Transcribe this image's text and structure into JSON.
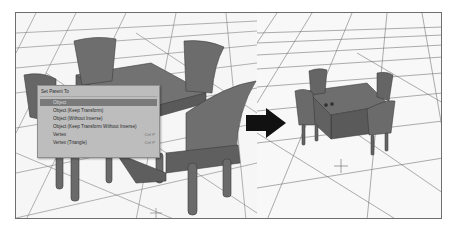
{
  "figure": {
    "frame_border_color": "#6e6e6e",
    "grid_line_color": "#4a4a4a",
    "model_color": "#676767"
  },
  "menu": {
    "title": "Set Parent To",
    "items": [
      {
        "label": "Object",
        "shortcut": "",
        "selected": true
      },
      {
        "label": "Object (Keep Transform)",
        "shortcut": "",
        "selected": false
      },
      {
        "label": "Object (Without Inverse)",
        "shortcut": "",
        "selected": false
      },
      {
        "label": "Object (Keep Transform Without Inverse)",
        "shortcut": "",
        "selected": false
      },
      {
        "label": "Vertex",
        "shortcut": "Ctrl P",
        "selected": false
      },
      {
        "label": "Vertex (Triangle)",
        "shortcut": "Ctrl P",
        "selected": false
      }
    ],
    "background_color": "#bdbdbd",
    "selected_color": "#7a7a7a"
  },
  "arrow": {
    "icon": "right-arrow-icon",
    "color": "#111111"
  },
  "left_viewport": {
    "scene": "table-with-four-chairs-large",
    "icon": "3d-cursor-icon"
  },
  "right_viewport": {
    "scene": "table-with-four-chairs-small",
    "icon": "3d-cursor-icon"
  }
}
